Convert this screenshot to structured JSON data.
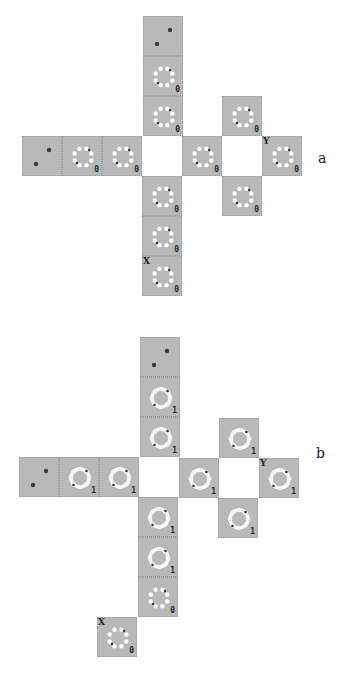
{
  "figure": {
    "panels": [
      {
        "label": "a",
        "label_pos": [
          318,
          150
        ],
        "cell_size": 40,
        "cells": [
          {
            "x": 143,
            "y": 16,
            "kind": "two-dots",
            "num": ""
          },
          {
            "x": 143,
            "y": 56,
            "kind": "ring-dots",
            "num": "0"
          },
          {
            "x": 143,
            "y": 96,
            "kind": "ring-dots",
            "num": "0"
          },
          {
            "x": 222,
            "y": 96,
            "kind": "ring-dots",
            "num": "0"
          },
          {
            "x": 22,
            "y": 136,
            "kind": "two-dots",
            "num": ""
          },
          {
            "x": 62,
            "y": 136,
            "kind": "ring-dots",
            "num": "0"
          },
          {
            "x": 102,
            "y": 136,
            "kind": "ring-dots",
            "num": "0"
          },
          {
            "x": 142,
            "y": 136,
            "kind": "blank",
            "num": ""
          },
          {
            "x": 182,
            "y": 136,
            "kind": "ring-dots",
            "num": "0"
          },
          {
            "x": 222,
            "y": 136,
            "kind": "blank",
            "num": ""
          },
          {
            "x": 262,
            "y": 136,
            "kind": "ring-dots",
            "num": "0",
            "mark": "Y"
          },
          {
            "x": 142,
            "y": 176,
            "kind": "ring-dots",
            "num": "0"
          },
          {
            "x": 222,
            "y": 176,
            "kind": "ring-dots",
            "num": "0"
          },
          {
            "x": 142,
            "y": 216,
            "kind": "ring-dots",
            "num": "0"
          },
          {
            "x": 142,
            "y": 256,
            "kind": "ring-dots",
            "num": "0",
            "mark": "X"
          }
        ]
      },
      {
        "label": "b",
        "label_pos": [
          316,
          445
        ],
        "cell_size": 40,
        "cells": [
          {
            "x": 140,
            "y": 337,
            "kind": "two-dots",
            "num": ""
          },
          {
            "x": 140,
            "y": 377,
            "kind": "ring-solid",
            "num": "1"
          },
          {
            "x": 140,
            "y": 417,
            "kind": "ring-solid",
            "num": "1"
          },
          {
            "x": 219,
            "y": 418,
            "kind": "ring-solid",
            "num": "1"
          },
          {
            "x": 19,
            "y": 457,
            "kind": "two-dots",
            "num": ""
          },
          {
            "x": 59,
            "y": 457,
            "kind": "ring-solid",
            "num": "1"
          },
          {
            "x": 99,
            "y": 457,
            "kind": "ring-solid",
            "num": "1"
          },
          {
            "x": 139,
            "y": 457,
            "kind": "blank",
            "num": ""
          },
          {
            "x": 179,
            "y": 458,
            "kind": "ring-solid",
            "num": "1"
          },
          {
            "x": 219,
            "y": 458,
            "kind": "blank",
            "num": ""
          },
          {
            "x": 259,
            "y": 458,
            "kind": "ring-solid",
            "num": "1",
            "mark": "Y"
          },
          {
            "x": 138,
            "y": 497,
            "kind": "ring-solid",
            "num": "1"
          },
          {
            "x": 218,
            "y": 498,
            "kind": "ring-solid",
            "num": "1"
          },
          {
            "x": 138,
            "y": 537,
            "kind": "ring-solid",
            "num": "1"
          },
          {
            "x": 138,
            "y": 577,
            "kind": "ring-dots",
            "num": "0"
          },
          {
            "x": 97,
            "y": 617,
            "kind": "ring-dots",
            "num": "0",
            "mark": "X"
          }
        ]
      }
    ]
  },
  "colors": {
    "cell_fill": "#b9b9b9",
    "dot_dark": "#3a3a3a",
    "ring_white": "#ffffff"
  }
}
